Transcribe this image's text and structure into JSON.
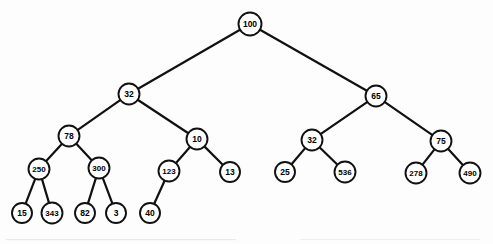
{
  "figure": {
    "name": "binary-tree-diagram",
    "width": 493,
    "height": 244,
    "background_color": "#fdfdfd",
    "node_fill_color": "#ffffff",
    "node_stroke_color": "#111111",
    "edge_color": "#111111",
    "label_color": "#000000"
  },
  "chart_data": {
    "type": "diagram",
    "diagram_kind": "binary-tree",
    "title": "",
    "node_count": 21,
    "depth": 5,
    "root": "100",
    "levels": [
      [
        "100"
      ],
      [
        "32",
        "65"
      ],
      [
        "78",
        "10",
        "32",
        "75"
      ],
      [
        "250",
        "300",
        "123",
        "13",
        "25",
        "536",
        "278",
        "490"
      ],
      [
        "15",
        "343",
        "82",
        "3",
        "40"
      ]
    ],
    "nodes": [
      {
        "id": "n1",
        "label": "100",
        "cx": 250,
        "cy": 24,
        "r": 11.5,
        "font_size": 8.5,
        "level": 0
      },
      {
        "id": "n2",
        "label": "32",
        "cx": 129,
        "cy": 94,
        "r": 10.5,
        "font_size": 8.5,
        "level": 1
      },
      {
        "id": "n3",
        "label": "65",
        "cx": 376,
        "cy": 96,
        "r": 10.5,
        "font_size": 8.5,
        "level": 1
      },
      {
        "id": "n4",
        "label": "78",
        "cx": 69,
        "cy": 136,
        "r": 10.5,
        "font_size": 8.5,
        "level": 2
      },
      {
        "id": "n5",
        "label": "10",
        "cx": 197,
        "cy": 139,
        "r": 10.5,
        "font_size": 8.5,
        "level": 2
      },
      {
        "id": "n6",
        "label": "32",
        "cx": 312,
        "cy": 140,
        "r": 10.5,
        "font_size": 8.5,
        "level": 2
      },
      {
        "id": "n7",
        "label": "75",
        "cx": 441,
        "cy": 141,
        "r": 10.5,
        "font_size": 8.5,
        "level": 2
      },
      {
        "id": "n8",
        "label": "250",
        "cx": 39,
        "cy": 169,
        "r": 10.5,
        "font_size": 8,
        "level": 3
      },
      {
        "id": "n9",
        "label": "300",
        "cx": 99,
        "cy": 168,
        "r": 10.5,
        "font_size": 8,
        "level": 3
      },
      {
        "id": "n10",
        "label": "123",
        "cx": 169,
        "cy": 171,
        "r": 10.5,
        "font_size": 8,
        "level": 3
      },
      {
        "id": "n11",
        "label": "13",
        "cx": 230,
        "cy": 172,
        "r": 10,
        "font_size": 8.5,
        "level": 3
      },
      {
        "id": "n12",
        "label": "25",
        "cx": 285,
        "cy": 172,
        "r": 10,
        "font_size": 8.5,
        "level": 3
      },
      {
        "id": "n13",
        "label": "536",
        "cx": 345,
        "cy": 172,
        "r": 10.5,
        "font_size": 8,
        "level": 3
      },
      {
        "id": "n14",
        "label": "278",
        "cx": 416,
        "cy": 173,
        "r": 10.5,
        "font_size": 8,
        "level": 3
      },
      {
        "id": "n15",
        "label": "490",
        "cx": 470,
        "cy": 173,
        "r": 10.5,
        "font_size": 8,
        "level": 3
      },
      {
        "id": "n16",
        "label": "15",
        "cx": 22,
        "cy": 213,
        "r": 10,
        "font_size": 8.5,
        "level": 4
      },
      {
        "id": "n17",
        "label": "343",
        "cx": 52,
        "cy": 213,
        "r": 10.5,
        "font_size": 8,
        "level": 4
      },
      {
        "id": "n18",
        "label": "82",
        "cx": 85,
        "cy": 213,
        "r": 10,
        "font_size": 8.5,
        "level": 4
      },
      {
        "id": "n19",
        "label": "3",
        "cx": 116,
        "cy": 213,
        "r": 10,
        "font_size": 8.5,
        "level": 4
      },
      {
        "id": "n20",
        "label": "40",
        "cx": 150,
        "cy": 213,
        "r": 10,
        "font_size": 8.5,
        "level": 4
      }
    ],
    "edges": [
      {
        "from": "n1",
        "to": "n2",
        "side": "left"
      },
      {
        "from": "n1",
        "to": "n3",
        "side": "right"
      },
      {
        "from": "n2",
        "to": "n4",
        "side": "left"
      },
      {
        "from": "n2",
        "to": "n5",
        "side": "right"
      },
      {
        "from": "n3",
        "to": "n6",
        "side": "left"
      },
      {
        "from": "n3",
        "to": "n7",
        "side": "right"
      },
      {
        "from": "n4",
        "to": "n8",
        "side": "left"
      },
      {
        "from": "n4",
        "to": "n9",
        "side": "right"
      },
      {
        "from": "n5",
        "to": "n10",
        "side": "left"
      },
      {
        "from": "n5",
        "to": "n11",
        "side": "right"
      },
      {
        "from": "n6",
        "to": "n12",
        "side": "left"
      },
      {
        "from": "n6",
        "to": "n13",
        "side": "right"
      },
      {
        "from": "n7",
        "to": "n14",
        "side": "left"
      },
      {
        "from": "n7",
        "to": "n15",
        "side": "right"
      },
      {
        "from": "n8",
        "to": "n16",
        "side": "left"
      },
      {
        "from": "n8",
        "to": "n17",
        "side": "right"
      },
      {
        "from": "n9",
        "to": "n18",
        "side": "left"
      },
      {
        "from": "n9",
        "to": "n19",
        "side": "right"
      },
      {
        "from": "n10",
        "to": "n20",
        "side": "left"
      }
    ]
  }
}
